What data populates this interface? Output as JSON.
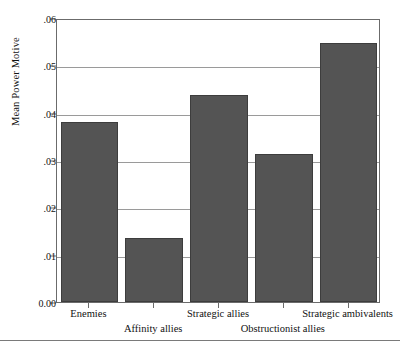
{
  "chart_data": {
    "type": "bar",
    "title": "",
    "subtitle": "",
    "xlabel": "",
    "ylabel": "Mean Power Motive",
    "categories": [
      "Enemies",
      "Affinity allies",
      "Strategic allies",
      "Obstructionist allies",
      "Strategic ambivalents"
    ],
    "values": [
      0.038,
      0.0135,
      0.0438,
      0.0313,
      0.0548
    ],
    "ylim": [
      0.0,
      0.06
    ],
    "yticks": [
      0.0,
      0.01,
      0.02,
      0.03,
      0.04,
      0.05,
      0.06
    ],
    "ytick_labels": [
      "0.00",
      ".01",
      ".02",
      ".03",
      ".04",
      ".05",
      ".06"
    ],
    "grid": "horizontal",
    "legend": "none",
    "bar_color": "#545454",
    "bar_edge_color": "#3d3d3d",
    "gridline_color": "#9a9a9a",
    "frame_color": "#6b6b6b",
    "background": "#ffffff",
    "label_rows": [
      0,
      1,
      0,
      1,
      0
    ],
    "annotations": []
  }
}
